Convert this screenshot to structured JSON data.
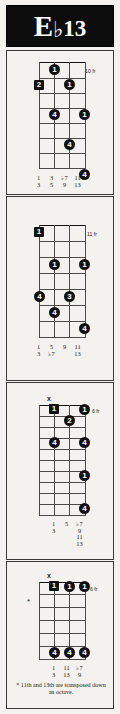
{
  "chord": {
    "root": "E",
    "accidental": "♭",
    "extension": "13",
    "full_name": "Eb13"
  },
  "diagrams": [
    {
      "id": "voicing-1",
      "fret_label": "10 fr",
      "open_markers": [],
      "dots": [
        {
          "string": 2,
          "fret": 1,
          "finger": "1",
          "shape": "circle"
        },
        {
          "string": 1,
          "fret": 2,
          "finger": "2",
          "shape": "square"
        },
        {
          "string": 3,
          "fret": 2,
          "finger": "1",
          "shape": "circle"
        },
        {
          "string": 2,
          "fret": 4,
          "finger": "4",
          "shape": "circle"
        },
        {
          "string": 4,
          "fret": 4,
          "finger": "1",
          "shape": "circle"
        },
        {
          "string": 3,
          "fret": 6,
          "finger": "4",
          "shape": "circle"
        },
        {
          "string": 4,
          "fret": 8,
          "finger": "4",
          "shape": "circle"
        }
      ],
      "intervals": [
        [
          "1",
          "3"
        ],
        [
          "3",
          "5"
        ],
        [
          "♭7",
          "9"
        ],
        [
          "11",
          "13"
        ]
      ],
      "footnote": ""
    },
    {
      "id": "voicing-2",
      "fret_label": "11 fr",
      "open_markers": [],
      "dots": [
        {
          "string": 1,
          "fret": 1,
          "finger": "1",
          "shape": "square"
        },
        {
          "string": 2,
          "fret": 3,
          "finger": "1",
          "shape": "circle"
        },
        {
          "string": 4,
          "fret": 3,
          "finger": "1",
          "shape": "circle"
        },
        {
          "string": 1,
          "fret": 5,
          "finger": "4",
          "shape": "circle"
        },
        {
          "string": 3,
          "fret": 5,
          "finger": "3",
          "shape": "circle"
        },
        {
          "string": 2,
          "fret": 6,
          "finger": "4",
          "shape": "circle"
        },
        {
          "string": 4,
          "fret": 7,
          "finger": "4",
          "shape": "circle"
        }
      ],
      "intervals": [
        [
          "1",
          "3"
        ],
        [
          "5",
          "♭7"
        ],
        [
          "9",
          ""
        ],
        [
          "11",
          "13"
        ]
      ],
      "footnote": ""
    },
    {
      "id": "voicing-3",
      "fret_label": "6 fr",
      "open_markers": [
        {
          "string": 1,
          "symbol": "x"
        }
      ],
      "dots": [
        {
          "string": 2,
          "fret": 1,
          "finger": "1",
          "shape": "square"
        },
        {
          "string": 4,
          "fret": 1,
          "finger": "1",
          "shape": "circle"
        },
        {
          "string": 3,
          "fret": 2,
          "finger": "2",
          "shape": "circle"
        },
        {
          "string": 2,
          "fret": 4,
          "finger": "4",
          "shape": "circle"
        },
        {
          "string": 4,
          "fret": 4,
          "finger": "4",
          "shape": "circle"
        },
        {
          "string": 4,
          "fret": 7,
          "finger": "1",
          "shape": "circle"
        },
        {
          "string": 4,
          "fret": 10,
          "finger": "4",
          "shape": "circle"
        }
      ],
      "intervals": [
        [
          "1",
          "3"
        ],
        [
          "5"
        ],
        [
          "♭7",
          "9",
          "11",
          "13"
        ]
      ],
      "footnote": ""
    },
    {
      "id": "voicing-4",
      "fret_label": "6 fr",
      "open_markers": [
        {
          "string": 1,
          "symbol": "x"
        }
      ],
      "dots": [
        {
          "string": 2,
          "fret": 1,
          "finger": "1",
          "shape": "square"
        },
        {
          "string": 3,
          "fret": 1,
          "finger": "1",
          "shape": "circle"
        },
        {
          "string": 4,
          "fret": 1,
          "finger": "1",
          "shape": "circle"
        },
        {
          "string": 2,
          "fret": 6,
          "finger": "4",
          "shape": "circle"
        },
        {
          "string": 3,
          "fret": 6,
          "finger": "4",
          "shape": "circle"
        },
        {
          "string": 4,
          "fret": 6,
          "finger": "4",
          "shape": "circle"
        }
      ],
      "intervals": [
        [
          "1",
          "3"
        ],
        [
          "11",
          "13"
        ],
        [
          "♭7",
          "9"
        ]
      ],
      "star_marker": "*",
      "footnote": "* 11th and 13th are transposed down an octave."
    }
  ]
}
